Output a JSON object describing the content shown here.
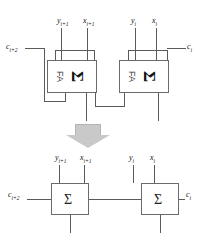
{
  "diagram": {
    "colors": {
      "wire": "#5a5a5a",
      "box_border": "#6b6b6b",
      "box_fill": "#ffffff",
      "arrow_fill": "#c9c9c9",
      "text": "#111111"
    },
    "top": {
      "section_name": "full-adder-pair",
      "blocks": [
        {
          "id": "fa-high",
          "module_label": "FA",
          "operator_glyph": "Σ",
          "orientation": "rotated-90",
          "inputs": [
            "y_{i+1}",
            "x_{i+1}"
          ],
          "carry_in": "c_{i+2}"
        },
        {
          "id": "fa-low",
          "module_label": "FA",
          "operator_glyph": "Σ",
          "orientation": "rotated-90",
          "inputs": [
            "y_i",
            "x_i"
          ],
          "carry_out": "c_i"
        }
      ],
      "labels": {
        "y_high": "y",
        "y_high_sub": "i+1",
        "x_high": "x",
        "x_high_sub": "i+1",
        "y_low": "y",
        "y_low_sub": "i",
        "x_low": "x",
        "x_low_sub": "i",
        "carry_left": "c",
        "carry_left_sub": "i+2",
        "carry_right": "c",
        "carry_right_sub": "i"
      }
    },
    "transform": {
      "name": "equivalence-arrow",
      "direction": "down",
      "fill": "#c9c9c9"
    },
    "bottom": {
      "section_name": "sigma-pair",
      "blocks": [
        {
          "id": "sigma-high",
          "operator_glyph": "Σ",
          "orientation": "upright",
          "inputs": [
            "y_{i+1}",
            "x_{i+1}"
          ],
          "carry_in": "c_{i+2}"
        },
        {
          "id": "sigma-low",
          "operator_glyph": "Σ",
          "orientation": "upright",
          "inputs": [
            "y_i",
            "x_i"
          ],
          "carry_out": "c_i"
        }
      ],
      "labels": {
        "y_high": "y",
        "y_high_sub": "i+1",
        "x_high": "x",
        "x_high_sub": "i+1",
        "y_low": "y",
        "y_low_sub": "i",
        "x_low": "x",
        "x_low_sub": "i",
        "carry_left": "c",
        "carry_left_sub": "i+2",
        "carry_right": "c",
        "carry_right_sub": "i"
      }
    }
  }
}
